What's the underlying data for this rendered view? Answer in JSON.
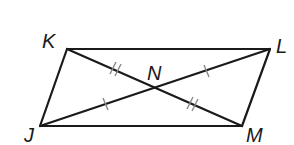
{
  "diagram": {
    "type": "parallelogram-with-diagonals",
    "vertices": {
      "K": {
        "label": "K",
        "x": 67,
        "y": 49
      },
      "L": {
        "label": "L",
        "x": 270,
        "y": 49
      },
      "M": {
        "label": "M",
        "x": 242,
        "y": 126
      },
      "J": {
        "label": "J",
        "x": 40,
        "y": 126
      }
    },
    "intersection": {
      "label": "N",
      "x": 154,
      "y": 88
    },
    "labels": {
      "K": "K",
      "L": "L",
      "M": "M",
      "J": "J",
      "N": "N"
    },
    "congruence_marks": [
      {
        "segment": "KN",
        "ticks": 2
      },
      {
        "segment": "NM",
        "ticks": 2
      },
      {
        "segment": "JN",
        "ticks": 1
      },
      {
        "segment": "NL",
        "ticks": 1
      }
    ],
    "colors": {
      "line": "#1a1a1a",
      "tick": "#888888",
      "background": "#ffffff"
    }
  }
}
